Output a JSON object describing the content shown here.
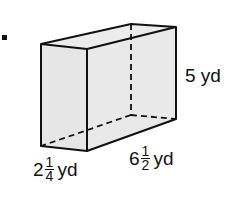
{
  "figure": {
    "problem_marker": ".",
    "shape": "rectangular-prism",
    "fill_color": "#e6e6e6",
    "stroke_color": "#111111",
    "labels": {
      "height": {
        "whole": "5",
        "unit": "yd",
        "text": "5 yd"
      },
      "width": {
        "whole": "2",
        "num": "1",
        "den": "4",
        "unit": "yd"
      },
      "length": {
        "whole": "6",
        "num": "1",
        "den": "2",
        "unit": "yd"
      }
    }
  }
}
